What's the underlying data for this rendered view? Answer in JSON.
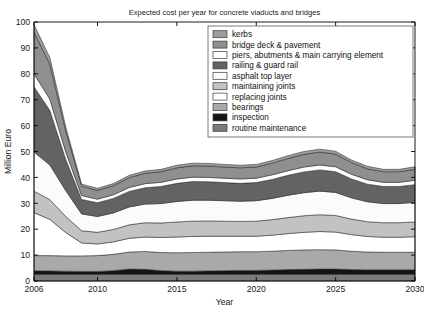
{
  "chart_data": {
    "type": "area",
    "title": "Expected cost per year for concrete viaducts and bridges",
    "xlabel": "Year",
    "ylabel": "Million Euro",
    "xlim": [
      2006,
      2030
    ],
    "ylim": [
      0,
      100
    ],
    "ytick_step": 10,
    "yticks": [
      0,
      10,
      20,
      30,
      40,
      50,
      60,
      70,
      80,
      90,
      100
    ],
    "xticks": [
      2006,
      2010,
      2015,
      2020,
      2025,
      2030
    ],
    "grid": false,
    "stacked": true,
    "legend_position": "top-right",
    "x": [
      2006,
      2007,
      2008,
      2009,
      2010,
      2011,
      2012,
      2013,
      2014,
      2015,
      2016,
      2017,
      2018,
      2019,
      2020,
      2021,
      2022,
      2023,
      2024,
      2025,
      2026,
      2027,
      2028,
      2029,
      2030
    ],
    "series": [
      {
        "name": "routine maintenance",
        "color": "#7b7b7b",
        "values": [
          2.6,
          2.6,
          2.6,
          2.6,
          2.6,
          2.6,
          2.6,
          2.6,
          2.6,
          2.6,
          2.6,
          2.6,
          2.6,
          2.6,
          2.6,
          2.6,
          2.6,
          2.6,
          2.6,
          2.6,
          2.6,
          2.6,
          2.6,
          2.6,
          2.6
        ]
      },
      {
        "name": "inspection",
        "color": "#141414",
        "values": [
          1.3,
          1.3,
          1.2,
          1.1,
          1.1,
          1.4,
          2.0,
          1.9,
          1.4,
          1.2,
          1.2,
          1.3,
          1.4,
          1.5,
          1.5,
          1.6,
          1.8,
          1.9,
          2.0,
          2.0,
          1.8,
          1.7,
          1.7,
          1.7,
          1.7
        ]
      },
      {
        "name": "bearings",
        "color": "#a9a9a9",
        "values": [
          5.9,
          5.9,
          5.9,
          6.0,
          6.1,
          6.3,
          6.6,
          6.9,
          7.0,
          7.1,
          7.2,
          7.2,
          7.2,
          7.2,
          7.2,
          7.3,
          7.4,
          7.5,
          7.5,
          7.4,
          7.1,
          6.9,
          6.8,
          6.8,
          6.8
        ]
      },
      {
        "name": "replacing joints",
        "color": "#ffffff",
        "values": [
          16.6,
          14.0,
          9.0,
          5.0,
          4.5,
          4.8,
          5.3,
          5.6,
          5.8,
          6.1,
          6.2,
          6.2,
          6.1,
          6.0,
          6.0,
          6.2,
          6.5,
          6.8,
          7.0,
          6.9,
          6.4,
          6.0,
          5.8,
          5.8,
          6.0
        ]
      },
      {
        "name": "maintaining joints",
        "color": "#c2c2c2",
        "values": [
          8.3,
          7.6,
          6.2,
          4.7,
          4.5,
          4.8,
          5.2,
          5.5,
          5.6,
          5.8,
          5.9,
          5.9,
          5.8,
          5.7,
          5.8,
          6.0,
          6.2,
          6.4,
          6.5,
          6.4,
          6.0,
          5.7,
          5.6,
          5.6,
          5.7
        ]
      },
      {
        "name": "asphalt top layer",
        "color": "#fbfbfb",
        "values": [
          15.1,
          13.4,
          10.0,
          6.5,
          6.1,
          6.4,
          6.9,
          7.2,
          7.5,
          7.9,
          8.1,
          8.0,
          7.9,
          7.8,
          7.9,
          8.2,
          8.6,
          8.9,
          9.1,
          8.9,
          8.2,
          7.7,
          7.4,
          7.4,
          7.6
        ]
      },
      {
        "name": "railing & guard rail",
        "color": "#636363",
        "values": [
          25.2,
          21.0,
          12.0,
          5.6,
          5.3,
          5.6,
          6.0,
          6.3,
          6.6,
          7.0,
          7.2,
          7.1,
          7.0,
          6.9,
          7.0,
          7.3,
          7.7,
          8.0,
          8.2,
          8.0,
          7.3,
          6.8,
          6.6,
          6.6,
          6.8
        ]
      },
      {
        "name": "piers, abutments & main carrying element",
        "color": "#fdfdfd",
        "values": [
          5.0,
          4.4,
          3.0,
          1.5,
          1.4,
          1.4,
          1.5,
          1.6,
          1.6,
          1.7,
          1.7,
          1.7,
          1.7,
          1.7,
          1.7,
          1.8,
          1.8,
          1.9,
          1.9,
          1.9,
          1.8,
          1.7,
          1.6,
          1.6,
          1.7
        ]
      },
      {
        "name": "bridge deck & pavement",
        "color": "#8f8f8f",
        "values": [
          16.1,
          13.5,
          8.0,
          3.6,
          3.4,
          3.5,
          3.8,
          4.0,
          4.1,
          4.3,
          4.4,
          4.4,
          4.3,
          4.3,
          4.3,
          4.5,
          4.7,
          4.9,
          5.0,
          4.9,
          4.5,
          4.2,
          4.1,
          4.1,
          4.2
        ]
      },
      {
        "name": "kerbs",
        "color": "#9c9c9c",
        "values": [
          2.9,
          2.5,
          1.6,
          0.8,
          0.8,
          0.8,
          0.9,
          0.9,
          0.9,
          1.0,
          1.0,
          1.0,
          1.0,
          1.0,
          1.0,
          1.0,
          1.1,
          1.1,
          1.1,
          1.1,
          1.0,
          1.0,
          0.9,
          0.9,
          1.0
        ]
      }
    ],
    "legend_entries": [
      {
        "label": "kerbs",
        "color": "#9c9c9c"
      },
      {
        "label": "bridge deck & pavement",
        "color": "#8f8f8f"
      },
      {
        "label": "piers, abutments & main carrying element",
        "color": "#fdfdfd"
      },
      {
        "label": "railing & guard rail",
        "color": "#636363"
      },
      {
        "label": "asphalt top layer",
        "color": "#fbfbfb"
      },
      {
        "label": "maintaining joints",
        "color": "#c2c2c2"
      },
      {
        "label": "replacing joints",
        "color": "#ffffff"
      },
      {
        "label": "bearings",
        "color": "#a9a9a9"
      },
      {
        "label": "inspection",
        "color": "#141414"
      },
      {
        "label": "routine maintenance",
        "color": "#7b7b7b"
      }
    ]
  },
  "figure": {
    "background": "#ffffff",
    "axis_color": "#000000"
  }
}
